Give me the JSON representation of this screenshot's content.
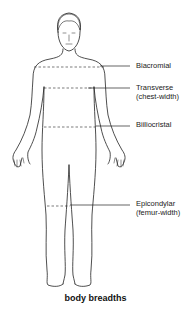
{
  "diagram": {
    "caption": "body breadths",
    "labels": [
      {
        "id": "biacromial",
        "line1": "Biacromial",
        "line2": ""
      },
      {
        "id": "transverse",
        "line1": "Transverse",
        "line2": "(chest-width)"
      },
      {
        "id": "biiliocristal",
        "line1": "Biiliocristal",
        "line2": ""
      },
      {
        "id": "epicondylar",
        "line1": "Epicondylar",
        "line2": "(femur-width)"
      }
    ],
    "line_color": "#222222",
    "background": "#ffffff"
  }
}
